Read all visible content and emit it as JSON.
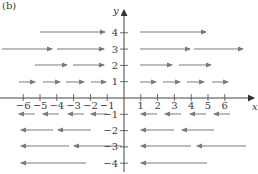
{
  "figure": {
    "panel_label": "(b)",
    "x_axis_label": "x",
    "y_axis_label": "y",
    "colors": {
      "axis": "#444444",
      "arrow": "#7a7a7a",
      "text": "#3a3a3a"
    }
  },
  "chart_data": {
    "type": "vector-field",
    "title": "",
    "xlabel": "x",
    "ylabel": "y",
    "x_ticks": [
      -6,
      -5,
      -4,
      -3,
      -2,
      -1,
      1,
      2,
      3,
      4,
      5,
      6
    ],
    "y_ticks": [
      4,
      3,
      2,
      1,
      -1,
      -2,
      -3,
      -4
    ],
    "x_tick_labels": [
      "−6",
      "−5",
      "−4",
      "−3",
      "−2",
      "−1",
      "1",
      "2",
      "3",
      "4",
      "5",
      "6"
    ],
    "y_tick_labels": [
      "4",
      "3",
      "2",
      "1",
      "−1",
      "−2",
      "−3",
      "−4"
    ],
    "field_description": "F(x, y) = y i  (horizontal vectors of length |y|, pointing right for y>0, left for y<0)",
    "rows": [
      {
        "y": 4,
        "direction": "right",
        "length": 4
      },
      {
        "y": 3,
        "direction": "right",
        "length": 3
      },
      {
        "y": 2,
        "direction": "right",
        "length": 2
      },
      {
        "y": 1,
        "direction": "right",
        "length": 1
      },
      {
        "y": -1,
        "direction": "left",
        "length": 1
      },
      {
        "y": -2,
        "direction": "left",
        "length": 2
      },
      {
        "y": -3,
        "direction": "left",
        "length": 3
      },
      {
        "y": -4,
        "direction": "left",
        "length": 4
      }
    ],
    "arrows_px": [
      {
        "y": 32,
        "segs": [
          [
            40,
            105
          ],
          [
            140,
            206
          ]
        ],
        "dir": 1
      },
      {
        "y": 49,
        "segs": [
          [
            2,
            52
          ],
          [
            57,
            104
          ],
          [
            140,
            190
          ],
          [
            194,
            243
          ]
        ],
        "dir": 1
      },
      {
        "y": 65,
        "segs": [
          [
            35,
            67
          ],
          [
            73,
            104
          ],
          [
            140,
            172
          ],
          [
            179,
            211
          ]
        ],
        "dir": 1
      },
      {
        "y": 82,
        "segs": [
          [
            19,
            35
          ],
          [
            43,
            60
          ],
          [
            66,
            84
          ],
          [
            91,
            106
          ],
          [
            140,
            156
          ],
          [
            163,
            180
          ],
          [
            187,
            204
          ],
          [
            212,
            228
          ]
        ],
        "dir": 1
      },
      {
        "y": 114,
        "segs": [
          [
            19,
            35
          ],
          [
            43,
            59
          ],
          [
            68,
            84
          ],
          [
            91,
            107
          ],
          [
            141,
            157
          ],
          [
            165,
            181
          ],
          [
            190,
            206
          ],
          [
            214,
            230
          ]
        ],
        "dir": -1
      },
      {
        "y": 130,
        "segs": [
          [
            21,
            53
          ],
          [
            58,
            91
          ],
          [
            141,
            174
          ],
          [
            182,
            214
          ]
        ],
        "dir": -1
      },
      {
        "y": 146,
        "segs": [
          [
            21,
            69
          ],
          [
            74,
            122
          ],
          [
            141,
            191
          ],
          [
            197,
            246
          ]
        ],
        "dir": -1
      },
      {
        "y": 163,
        "segs": [
          [
            21,
            86
          ],
          [
            141,
            207
          ]
        ],
        "dir": -1
      }
    ],
    "xlim": [
      -7,
      7.5
    ],
    "ylim": [
      -4.7,
      5
    ],
    "grid": false,
    "legend": null
  }
}
